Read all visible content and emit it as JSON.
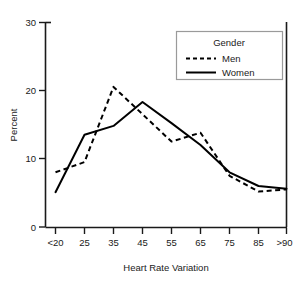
{
  "chart_data": {
    "type": "line",
    "title": "",
    "xlabel": "Heart Rate Variation",
    "ylabel": "Percent",
    "categories": [
      "<20",
      "25",
      "35",
      "45",
      "55",
      "65",
      "75",
      "85",
      ">90"
    ],
    "x_tick_labels": [
      "<20",
      "25",
      "35",
      "45",
      "55",
      "65",
      "75",
      "85",
      ">90"
    ],
    "y_tick_labels": [
      "0",
      "10",
      "20",
      "30"
    ],
    "y_ticks": [
      0,
      10,
      20,
      30
    ],
    "ylim": [
      0,
      30
    ],
    "grid": false,
    "legend_position": "top-right",
    "legend_title": "Gender",
    "series": [
      {
        "name": "Men",
        "style": "dashed",
        "color": "#000000",
        "values": [
          8.0,
          9.5,
          20.5,
          16.5,
          12.5,
          13.8,
          7.5,
          5.2,
          5.5
        ]
      },
      {
        "name": "Women",
        "style": "solid",
        "color": "#000000",
        "values": [
          5.1,
          13.5,
          14.8,
          18.3,
          15.2,
          12.0,
          8.0,
          6.0,
          5.6
        ]
      }
    ]
  },
  "legend": {
    "title": "Gender",
    "entries": [
      {
        "label": "Men",
        "style": "dashed"
      },
      {
        "label": "Women",
        "style": "solid"
      }
    ]
  },
  "axes": {
    "x_title": "Heart Rate Variation",
    "y_title": "Percent"
  }
}
